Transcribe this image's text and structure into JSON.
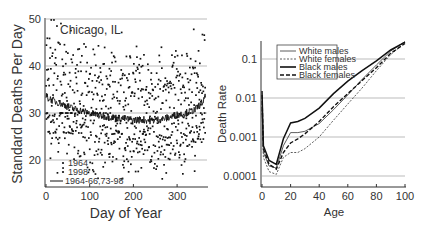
{
  "chart_data": [
    {
      "type": "scatter",
      "title": "",
      "annotation": "Chicago, IL",
      "xlabel": "Day of Year",
      "ylabel": "Standard Deaths Per Day",
      "xlim": [
        0,
        365
      ],
      "ylim": [
        15,
        50
      ],
      "xticks": [
        "0",
        "100",
        "200",
        "300"
      ],
      "yticks": [
        "20",
        "30",
        "40",
        "50"
      ],
      "grid": "horizontal",
      "legend": {
        "position": "lower-left",
        "entries": [
          "1964",
          "1998",
          "1964-66,73-98"
        ]
      },
      "series": [
        {
          "name": "1964",
          "kind": "points",
          "description": "daily values scattered mostly between 30 and 45, max ~50"
        },
        {
          "name": "1998",
          "kind": "points",
          "description": "daily values scattered mostly between 18 and 30"
        },
        {
          "name": "1964-66,73-98",
          "kind": "line",
          "x": [
            0,
            20,
            40,
            60,
            80,
            100,
            120,
            140,
            160,
            180,
            200,
            220,
            240,
            260,
            280,
            300,
            320,
            340,
            360,
            365
          ],
          "values": [
            33.5,
            32.5,
            31.8,
            31.0,
            30.5,
            30.0,
            29.5,
            29.2,
            29.0,
            28.8,
            28.5,
            28.6,
            28.4,
            28.6,
            29.0,
            29.6,
            30.0,
            30.6,
            32.5,
            33.5
          ]
        }
      ]
    },
    {
      "type": "line",
      "title": "",
      "xlabel": "Age",
      "ylabel": "Death Rate",
      "yscale": "log",
      "xlim": [
        0,
        100
      ],
      "ylim": [
        5e-05,
        0.3
      ],
      "xticks": [
        "0",
        "20",
        "40",
        "60",
        "80",
        "100"
      ],
      "yticks": [
        "0.0001",
        "0.001",
        "0.01",
        "0.1"
      ],
      "grid": "horizontal",
      "legend": {
        "position": "upper-left",
        "entries": [
          "White males",
          "White females",
          "Black males",
          "Black females"
        ]
      },
      "x": [
        0,
        1,
        5,
        10,
        15,
        20,
        25,
        30,
        40,
        50,
        60,
        70,
        80,
        90,
        100
      ],
      "series": [
        {
          "name": "White males",
          "style": "solid-thin",
          "values": [
            0.006,
            0.0004,
            0.00018,
            0.00016,
            0.0006,
            0.0013,
            0.0013,
            0.0014,
            0.0022,
            0.005,
            0.012,
            0.03,
            0.07,
            0.16,
            0.28
          ]
        },
        {
          "name": "White females",
          "style": "dashed-thin",
          "values": [
            0.005,
            0.0003,
            0.00013,
            0.00011,
            0.0003,
            0.0004,
            0.0004,
            0.0005,
            0.001,
            0.0027,
            0.007,
            0.018,
            0.05,
            0.13,
            0.26
          ]
        },
        {
          "name": "Black males",
          "style": "solid-thick",
          "values": [
            0.015,
            0.0006,
            0.00025,
            0.0002,
            0.0009,
            0.0023,
            0.0025,
            0.003,
            0.0055,
            0.013,
            0.027,
            0.05,
            0.09,
            0.17,
            0.27
          ]
        },
        {
          "name": "Black females",
          "style": "dashed-thick",
          "values": [
            0.012,
            0.0005,
            0.0002,
            0.00015,
            0.0004,
            0.0007,
            0.0009,
            0.0012,
            0.0025,
            0.006,
            0.013,
            0.028,
            0.06,
            0.14,
            0.25
          ]
        }
      ]
    }
  ],
  "left": {
    "annotation": "Chicago, IL",
    "xlabel": "Day of Year",
    "ylabel": "Standard Deaths Per Day",
    "xticks": [
      "0",
      "100",
      "200",
      "300"
    ],
    "yticks": [
      "20",
      "30",
      "40",
      "50"
    ],
    "legend": [
      "1964",
      "1998",
      "1964-66,73-98"
    ]
  },
  "right": {
    "xlabel": "Age",
    "ylabel": "Death Rate",
    "xticks": [
      "0",
      "20",
      "40",
      "60",
      "80",
      "100"
    ],
    "yticks": [
      "0.0001",
      "0.001",
      "0.01",
      "0.1"
    ],
    "legend": [
      "White males",
      "White females",
      "Black males",
      "Black females"
    ]
  }
}
